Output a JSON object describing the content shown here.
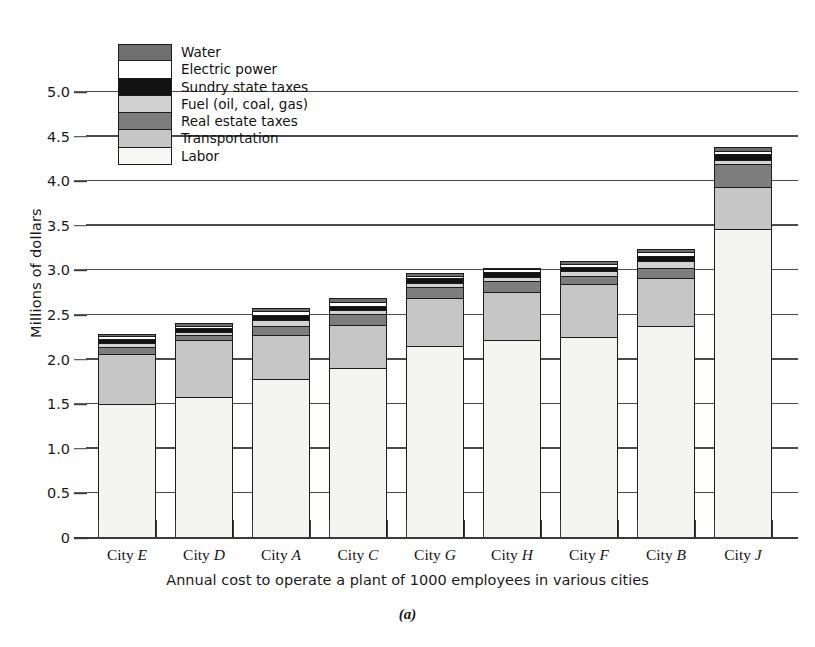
{
  "figure": {
    "label": "(a)",
    "ylabel": "Millions of dollars",
    "xcaption": "Annual cost to operate a plant of 1000 employees in various cities"
  },
  "legend": {
    "items": [
      {
        "key": "water",
        "label": "Water",
        "color": "#6f6f6f"
      },
      {
        "key": "electric",
        "label": "Electric power",
        "color": "#ffffff"
      },
      {
        "key": "sundry",
        "label": "Sundry state taxes",
        "color": "#121212"
      },
      {
        "key": "fuel",
        "label": "Fuel (oil, coal, gas)",
        "color": "#d2d2d2"
      },
      {
        "key": "realestate",
        "label": "Real estate taxes",
        "color": "#7d7d7d"
      },
      {
        "key": "transport",
        "label": "Transportation",
        "color": "#c6c6c6"
      },
      {
        "key": "labor",
        "label": "Labor",
        "color": "#f7f7f3"
      }
    ]
  },
  "yaxis": {
    "ticks": [
      "5.0",
      "4.5",
      "4.0",
      "3.5",
      "3.0",
      "2.5",
      "2.0",
      "1.5",
      "1.0",
      "0.5",
      "0"
    ],
    "min": 0,
    "max": 5.0,
    "step": 0.5
  },
  "xaxis": {
    "categories": [
      "City E",
      "City D",
      "City A",
      "City C",
      "City G",
      "City H",
      "City F",
      "City B",
      "City J"
    ],
    "category_prefix": "City",
    "category_letters": [
      "E",
      "D",
      "A",
      "C",
      "G",
      "H",
      "F",
      "B",
      "J"
    ]
  },
  "chart_data": {
    "type": "bar",
    "subtype": "stacked",
    "title": "",
    "subtitle": "",
    "xlabel": "Annual cost to operate a plant of 1000 employees in various cities",
    "ylabel": "Millions of dollars",
    "ylim": [
      0,
      5.0
    ],
    "ytick_step": 0.5,
    "grid": "horizontal",
    "legend_position": "upper-left-inside",
    "figure_label": "(a)",
    "categories": [
      "City E",
      "City D",
      "City A",
      "City C",
      "City G",
      "City H",
      "City F",
      "City B",
      "City J"
    ],
    "series": [
      {
        "name": "Labor",
        "values": [
          1.49,
          1.57,
          1.77,
          1.9,
          2.14,
          2.21,
          2.24,
          2.36,
          3.45
        ]
      },
      {
        "name": "Transportation",
        "values": [
          0.56,
          0.64,
          0.49,
          0.48,
          0.54,
          0.54,
          0.6,
          0.54,
          0.47
        ]
      },
      {
        "name": "Real estate taxes",
        "values": [
          0.08,
          0.05,
          0.11,
          0.12,
          0.12,
          0.12,
          0.09,
          0.12,
          0.26
        ]
      },
      {
        "name": "Fuel (oil, coal, gas)",
        "values": [
          0.05,
          0.04,
          0.06,
          0.04,
          0.05,
          0.05,
          0.05,
          0.07,
          0.05
        ]
      },
      {
        "name": "Sundry state taxes",
        "values": [
          0.04,
          0.04,
          0.06,
          0.05,
          0.05,
          0.05,
          0.05,
          0.06,
          0.06
        ]
      },
      {
        "name": "Electric power",
        "values": [
          0.03,
          0.03,
          0.04,
          0.05,
          0.03,
          0.03,
          0.03,
          0.05,
          0.04
        ]
      },
      {
        "name": "Water",
        "values": [
          0.04,
          0.04,
          0.05,
          0.05,
          0.04,
          0.03,
          0.04,
          0.04,
          0.05
        ]
      }
    ],
    "totals": [
      2.29,
      2.41,
      2.58,
      2.69,
      2.97,
      3.03,
      3.1,
      3.24,
      4.38
    ]
  }
}
